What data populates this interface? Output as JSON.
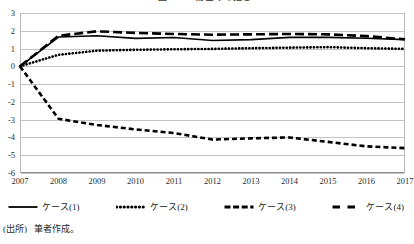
{
  "chart_data": {
    "type": "line",
    "title": "図5－6　貯蓄率の推移",
    "xlabel": "",
    "ylabel": "",
    "categories": [
      "2007",
      "2008",
      "2009",
      "2010",
      "2011",
      "2012",
      "2013",
      "2014",
      "2015",
      "2016",
      "2017"
    ],
    "ylim": [
      -6,
      3
    ],
    "yticks": [
      3,
      2,
      1,
      0,
      -1,
      -2,
      -3,
      -4,
      -5,
      -6
    ],
    "grid": true,
    "legend_position": "bottom",
    "series": [
      {
        "name": "ケース(1)",
        "style": "solid",
        "color": "#000000",
        "values": [
          0,
          1.65,
          1.72,
          1.57,
          1.62,
          1.45,
          1.5,
          1.63,
          1.63,
          1.58,
          1.5
        ]
      },
      {
        "name": "ケース(2)",
        "style": "dotted",
        "color": "#000000",
        "values": [
          0,
          0.65,
          0.88,
          0.93,
          0.96,
          0.98,
          1.02,
          1.05,
          1.08,
          1.02,
          0.98
        ]
      },
      {
        "name": "ケース(3)",
        "style": "dashed",
        "color": "#000000",
        "values": [
          0,
          -2.95,
          -3.3,
          -3.55,
          -3.75,
          -4.12,
          -4.05,
          -4.0,
          -4.25,
          -4.5,
          -4.6
        ]
      },
      {
        "name": "ケース(4)",
        "style": "long-dashed",
        "color": "#000000",
        "values": [
          0,
          1.72,
          1.97,
          1.88,
          1.82,
          1.78,
          1.8,
          1.82,
          1.8,
          1.7,
          1.52
        ]
      }
    ]
  },
  "legend": {
    "items": [
      {
        "label": "ケース(1)",
        "style": "solid"
      },
      {
        "label": "ケース(2)",
        "style": "dotted"
      },
      {
        "label": "ケース(3)",
        "style": "dashed"
      },
      {
        "label": "ケース(4)",
        "style": "long-dashed"
      }
    ]
  },
  "source": {
    "label": "(出所)",
    "text": "筆者作成。"
  }
}
